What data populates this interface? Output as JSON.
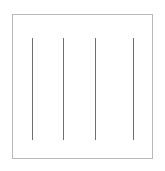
{
  "figure": {
    "background_color": "#ffffff",
    "canvas": {
      "width": 165,
      "height": 171
    }
  },
  "frame": {
    "name": "rectangular-border",
    "x": 12,
    "y": 14,
    "width": 141,
    "height": 145,
    "border_color": "#b9b9b9",
    "border_width": 1,
    "fill_color": "#ffffff"
  },
  "lines": {
    "count": 4,
    "color": "#6e6e6e",
    "thickness": 1,
    "orientation": "vertical",
    "y_top": 38,
    "y_bottom": 140,
    "items": [
      {
        "label": "line-1",
        "x": 32,
        "y_top": 38,
        "y_bottom": 140
      },
      {
        "label": "line-2",
        "x": 63,
        "y_top": 38,
        "y_bottom": 140
      },
      {
        "label": "line-3",
        "x": 95,
        "y_top": 38,
        "y_bottom": 140
      },
      {
        "label": "line-4",
        "x": 133,
        "y_top": 38,
        "y_bottom": 140
      }
    ]
  }
}
